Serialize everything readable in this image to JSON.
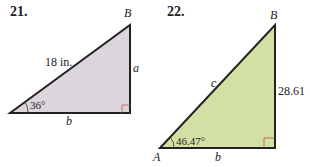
{
  "problems": [
    {
      "number": "21.",
      "vertex_top": "B",
      "hypotenuse": "18 in.",
      "side_vertical": "a",
      "side_base": "b",
      "angle": "36°",
      "fill_color": "#dcd6dc"
    },
    {
      "number": "22.",
      "vertex_top": "B",
      "vertex_left": "A",
      "hypotenuse": "c",
      "side_vertical": "28.61",
      "side_base": "b",
      "angle": "46.47°",
      "fill_color": "#d2e0a4"
    }
  ],
  "colors": {
    "stroke": "#222222",
    "right_angle_marker": "#c0504d"
  }
}
